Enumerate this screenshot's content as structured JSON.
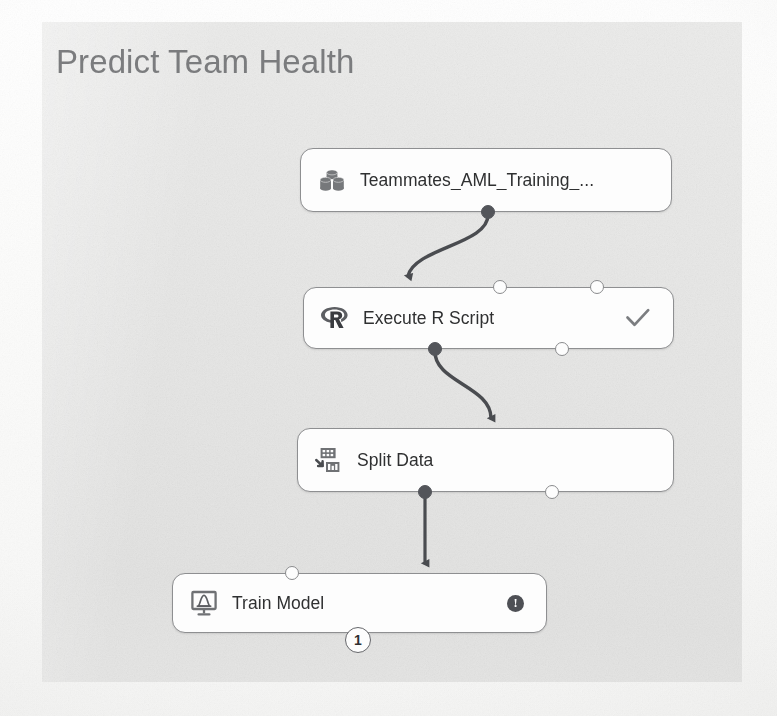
{
  "experiment": {
    "title": "Predict Team Health",
    "canvas_background": "#e6e6e5"
  },
  "nodes": [
    {
      "id": "dataset",
      "label": "Teammates_AML_Training_...",
      "icon": "dataset-cylinders-icon",
      "status": "",
      "x": 258,
      "y": 126,
      "w": 372,
      "h": 64
    },
    {
      "id": "execute-r-script",
      "label": "Execute R Script",
      "icon": "r-language-icon",
      "status": "check",
      "x": 261,
      "y": 265,
      "w": 371,
      "h": 62
    },
    {
      "id": "split-data",
      "label": "Split Data",
      "icon": "split-data-icon",
      "status": "",
      "x": 255,
      "y": 406,
      "w": 377,
      "h": 64
    },
    {
      "id": "train-model",
      "label": "Train Model",
      "icon": "train-model-monitor-icon",
      "status": "alert",
      "x": 130,
      "y": 551,
      "w": 375,
      "h": 60
    }
  ],
  "badges": {
    "train_model_order": "1",
    "train_model_alert": "!"
  },
  "colors": {
    "node_border": "#8e8f91",
    "node_fill": "#fdfdfd",
    "port_filled": "#53555a",
    "connector": "#4a4c50",
    "title_text": "#7b7c7e",
    "label_text": "#2f3031"
  }
}
